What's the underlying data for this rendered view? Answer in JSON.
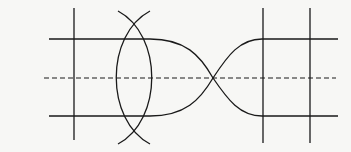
{
  "diagram": {
    "type": "geometric-line-figure",
    "stroke_color": "#1a1a1a",
    "background": "#f7f7f5",
    "elements": {
      "left_vertical": {
        "x": 74,
        "y1": 8,
        "y2": 140
      },
      "top_horizontal": {
        "y": 39,
        "x1": 49,
        "x2": 338
      },
      "bottom_horizontal": {
        "y": 116,
        "x1": 49,
        "x2": 338
      },
      "dashed_midline": {
        "y": 78,
        "x1": 44,
        "x2": 336
      },
      "lens_arcs": {
        "cross_top": [
          134,
          19
        ],
        "cross_bottom": [
          134,
          137
        ]
      },
      "cusp_curves": {
        "cusp_x": 213,
        "cusp_y": 78
      },
      "right_verticals": [
        263,
        310
      ]
    }
  }
}
